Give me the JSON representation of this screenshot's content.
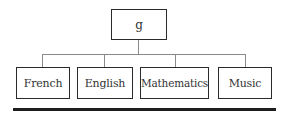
{
  "diagram": {
    "type": "hierarchy",
    "root": {
      "label": "g"
    },
    "children": [
      {
        "label": "French"
      },
      {
        "label": "English"
      },
      {
        "label": "Mathematics"
      },
      {
        "label": "Music"
      }
    ]
  }
}
